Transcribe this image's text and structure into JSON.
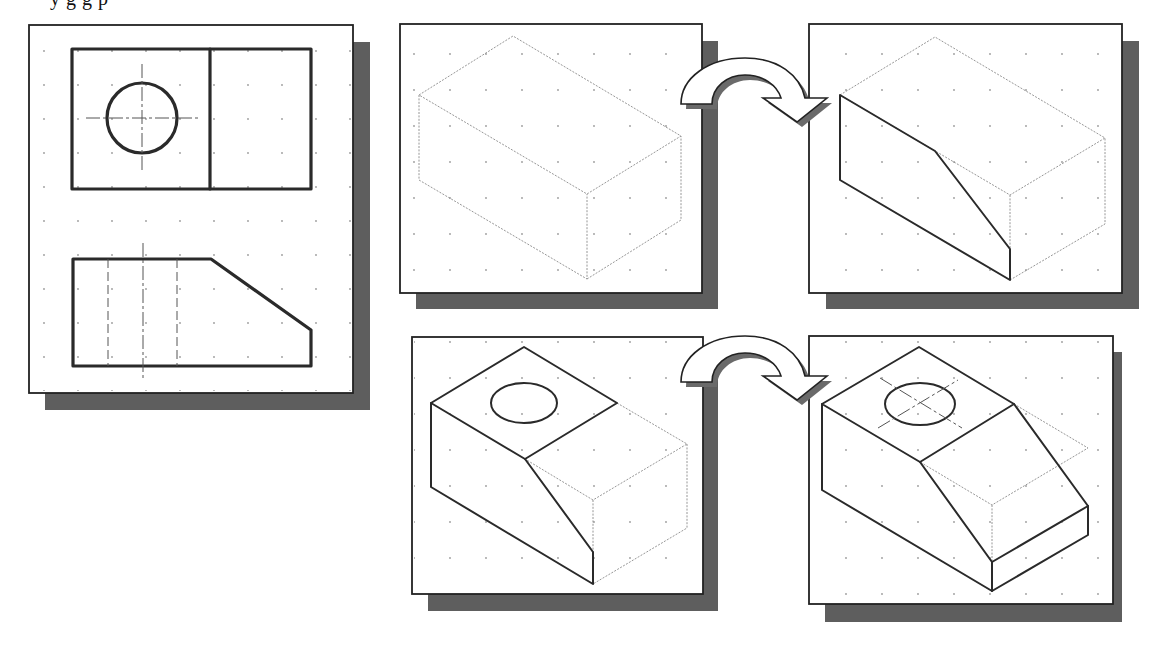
{
  "figure": {
    "caption_clipped": "y g g p",
    "colors": {
      "background": "#ffffff",
      "panel_border": "#222222",
      "shadow": "#5e5e5e",
      "grid_dot": "#9a9a9a",
      "visible_edge": "#2a2a2a",
      "construction_edge": "#8a8a8a"
    },
    "panels": [
      {
        "id": "orthographic-views",
        "label": "Top and front orthographic views",
        "x": 29,
        "y": 25,
        "w": 324,
        "h": 368
      },
      {
        "id": "step-1-box",
        "label": "Isometric bounding box",
        "x": 400,
        "y": 24,
        "w": 302,
        "h": 269
      },
      {
        "id": "step-2-slant",
        "label": "Slanted cut drawn on front face",
        "x": 809,
        "y": 24,
        "w": 313,
        "h": 269
      },
      {
        "id": "step-3-hole",
        "label": "Top face and hole ellipse added",
        "x": 412,
        "y": 337,
        "w": 291,
        "h": 257
      },
      {
        "id": "step-4-complete",
        "label": "Completed isometric with hole centerlines",
        "x": 809,
        "y": 336,
        "w": 304,
        "h": 268
      }
    ],
    "arrows": [
      {
        "id": "arrow-top",
        "from": "step-1-box",
        "to": "step-2-slant",
        "icon": "curved-arrow-icon"
      },
      {
        "id": "arrow-bottom",
        "from": "step-3-hole",
        "to": "step-4-complete",
        "icon": "curved-arrow-icon"
      }
    ]
  }
}
